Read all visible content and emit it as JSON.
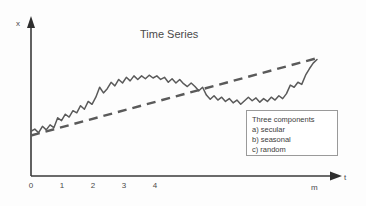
{
  "chart_data": {
    "type": "line",
    "title": "Time Series",
    "xlabel": "t",
    "ylabel": "x",
    "grid": false,
    "legend_position": "inside-bottom-right",
    "x_tick_labels": [
      "0",
      "1",
      "2",
      "3",
      "4"
    ],
    "x_axis_end_label": "m",
    "xlim": [
      0,
      9
    ],
    "ylim": [
      0,
      10
    ],
    "series": [
      {
        "name": "observed",
        "style": "solid-jagged",
        "color": "#5a5a5a",
        "x": [
          0.0,
          0.12,
          0.24,
          0.36,
          0.48,
          0.6,
          0.72,
          0.84,
          0.96,
          1.08,
          1.2,
          1.32,
          1.44,
          1.56,
          1.68,
          1.8,
          1.92,
          2.04,
          2.16,
          2.28,
          2.4,
          2.52,
          2.64,
          2.76,
          2.88,
          3.0,
          3.12,
          3.24,
          3.36,
          3.48,
          3.6,
          3.72,
          3.84,
          3.96,
          4.08,
          4.2,
          4.32,
          4.44,
          4.56,
          4.68,
          4.8,
          4.92,
          5.04,
          5.16,
          5.28,
          5.4,
          5.52,
          5.64,
          5.76,
          5.88,
          6.0,
          6.12,
          6.24,
          6.36,
          6.48,
          6.6,
          6.72,
          6.84,
          6.96,
          7.08,
          7.2,
          7.32,
          7.44,
          7.56,
          7.68,
          7.8,
          7.92,
          8.04,
          8.16,
          8.28,
          8.4,
          8.52,
          8.64,
          8.76,
          8.88,
          9.0
        ],
        "y": [
          3.15,
          3.3,
          3.05,
          3.5,
          3.25,
          3.6,
          3.4,
          4.1,
          3.9,
          4.35,
          4.15,
          4.6,
          4.45,
          4.95,
          4.7,
          5.25,
          5.05,
          5.55,
          6.25,
          5.85,
          6.15,
          6.6,
          6.35,
          6.8,
          6.55,
          6.95,
          6.7,
          7.05,
          6.8,
          7.05,
          6.85,
          7.1,
          6.9,
          7.05,
          6.8,
          6.95,
          6.6,
          6.85,
          6.55,
          6.8,
          6.5,
          6.3,
          6.55,
          6.3,
          6.0,
          6.25,
          5.7,
          5.4,
          5.65,
          5.35,
          5.55,
          5.25,
          5.45,
          5.15,
          5.35,
          5.05,
          5.3,
          5.55,
          5.3,
          5.5,
          5.2,
          5.45,
          5.25,
          5.55,
          5.35,
          5.65,
          5.45,
          5.8,
          6.4,
          6.25,
          6.6,
          6.45,
          7.1,
          7.55,
          7.95,
          8.2
        ]
      },
      {
        "name": "secular trend",
        "style": "dashed",
        "color": "#5a5a5a",
        "x": [
          0.0,
          9.0
        ],
        "y": [
          2.85,
          8.3
        ]
      }
    ],
    "annotations": {
      "legend_title": "Three components",
      "legend_items": [
        "a) secular",
        "b) seasonal",
        "c) random"
      ]
    }
  },
  "axis": {
    "y_label": "x",
    "x_label": "t",
    "x_end_marker": "m",
    "ticks": [
      {
        "label": "0",
        "px": 31
      },
      {
        "label": "1",
        "px": 62
      },
      {
        "label": "2",
        "px": 93
      },
      {
        "label": "3",
        "px": 124
      },
      {
        "label": "4",
        "px": 155
      }
    ]
  },
  "legend": {
    "title": "Three components",
    "item_a": "a) secular",
    "item_b": "b) seasonal",
    "item_c": "c) random"
  },
  "colors": {
    "background": "#fdfdfd",
    "axis": "#3a3a3a",
    "series": "#5a5a5a",
    "trend": "#5a5a5a",
    "text": "#4a4a4a",
    "legend_border": "#9a9a9a"
  }
}
